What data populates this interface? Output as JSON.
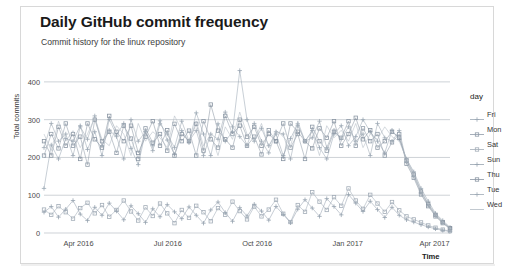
{
  "chart_data": {
    "type": "line",
    "title": "Daily GitHub commit frequency",
    "subtitle": "Commit history for the linux repository",
    "xlabel": "Time",
    "ylabel": "Total commits",
    "ylim": [
      0,
      450
    ],
    "yticks": [
      0,
      100,
      200,
      300,
      400
    ],
    "xticks": [
      "Apr 2016",
      "Jul 2016",
      "Oct 2016",
      "Jan 2017",
      "Apr 2017"
    ],
    "xtick_positions": [
      0.085,
      0.305,
      0.525,
      0.748,
      0.962
    ],
    "grid": true,
    "legend_position": "right",
    "legend_title": "day",
    "x_start": "2016-03-14",
    "x_end": "2017-04-17",
    "n_points_per_series": 57,
    "series": [
      {
        "name": "Fri",
        "color": "#9aa7b4",
        "marker": "plus",
        "values": [
          118,
          233,
          196,
          250,
          243,
          284,
          221,
          268,
          205,
          301,
          259,
          290,
          224,
          181,
          268,
          231,
          297,
          246,
          208,
          271,
          239,
          318,
          262,
          205,
          289,
          243,
          268,
          430,
          300,
          243,
          277,
          231,
          262,
          205,
          250,
          289,
          243,
          271,
          226,
          196,
          262,
          284,
          231,
          255,
          300,
          268,
          243,
          212,
          272,
          248,
          196,
          162,
          118,
          84,
          52,
          33,
          15
        ]
      },
      {
        "name": "Mon",
        "color": "#8f9ba8",
        "marker": "square",
        "values": [
          205,
          262,
          224,
          290,
          231,
          255,
          181,
          300,
          243,
          268,
          212,
          284,
          250,
          196,
          277,
          239,
          262,
          218,
          289,
          243,
          271,
          205,
          296,
          248,
          226,
          310,
          262,
          284,
          231,
          255,
          208,
          272,
          243,
          290,
          226,
          262,
          196,
          281,
          243,
          218,
          268,
          252,
          296,
          231,
          277,
          243,
          262,
          205,
          240,
          262,
          183,
          146,
          102,
          71,
          44,
          26,
          12
        ]
      },
      {
        "name": "Sat",
        "color": "#a3adb8",
        "marker": "square",
        "values": [
          62,
          48,
          71,
          55,
          38,
          66,
          80,
          52,
          74,
          43,
          61,
          86,
          57,
          33,
          68,
          45,
          78,
          52,
          26,
          61,
          40,
          72,
          55,
          31,
          66,
          48,
          83,
          58,
          36,
          70,
          44,
          62,
          88,
          51,
          29,
          74,
          56,
          108,
          83,
          61,
          95,
          72,
          118,
          86,
          64,
          101,
          78,
          56,
          82,
          60,
          44,
          36,
          28,
          20,
          14,
          9,
          5
        ]
      },
      {
        "name": "Sun",
        "color": "#97a3b0",
        "marker": "plus",
        "values": [
          55,
          70,
          42,
          63,
          86,
          50,
          33,
          68,
          47,
          79,
          58,
          35,
          72,
          51,
          28,
          64,
          43,
          75,
          56,
          38,
          69,
          47,
          26,
          61,
          82,
          54,
          31,
          67,
          45,
          76,
          58,
          34,
          70,
          49,
          27,
          63,
          88,
          66,
          44,
          91,
          70,
          48,
          102,
          79,
          57,
          84,
          62,
          41,
          68,
          47,
          35,
          29,
          22,
          16,
          11,
          7,
          4
        ]
      },
      {
        "name": "Thu",
        "color": "#8a96a3",
        "marker": "square",
        "values": [
          243,
          205,
          281,
          231,
          262,
          196,
          290,
          248,
          226,
          310,
          268,
          243,
          284,
          212,
          255,
          296,
          231,
          272,
          205,
          262,
          243,
          289,
          218,
          340,
          271,
          248,
          226,
          300,
          255,
          281,
          231,
          262,
          243,
          196,
          290,
          268,
          243,
          224,
          277,
          252,
          296,
          231,
          262,
          305,
          248,
          272,
          226,
          243,
          268,
          252,
          192,
          155,
          110,
          76,
          48,
          29,
          13
        ]
      },
      {
        "name": "Tue",
        "color": "#9ea9b5",
        "marker": "plus",
        "values": [
          226,
          290,
          243,
          262,
          205,
          281,
          248,
          310,
          231,
          272,
          255,
          196,
          300,
          243,
          268,
          218,
          289,
          262,
          226,
          296,
          243,
          271,
          205,
          262,
          248,
          320,
          281,
          255,
          231,
          290,
          243,
          212,
          268,
          262,
          196,
          284,
          243,
          252,
          296,
          226,
          272,
          248,
          281,
          243,
          262,
          205,
          290,
          252,
          243,
          271,
          188,
          150,
          106,
          73,
          46,
          27,
          11
        ]
      },
      {
        "name": "Wed",
        "color": "#b2bbc4",
        "marker": "line",
        "values": [
          262,
          218,
          296,
          243,
          271,
          226,
          262,
          305,
          248,
          231,
          284,
          262,
          205,
          290,
          243,
          268,
          252,
          226,
          310,
          272,
          243,
          296,
          231,
          262,
          205,
          281,
          248,
          320,
          262,
          243,
          290,
          226,
          272,
          255,
          231,
          296,
          243,
          268,
          205,
          284,
          252,
          272,
          243,
          290,
          226,
          262,
          248,
          281,
          255,
          243,
          196,
          158,
          112,
          78,
          50,
          30,
          14
        ]
      }
    ]
  }
}
